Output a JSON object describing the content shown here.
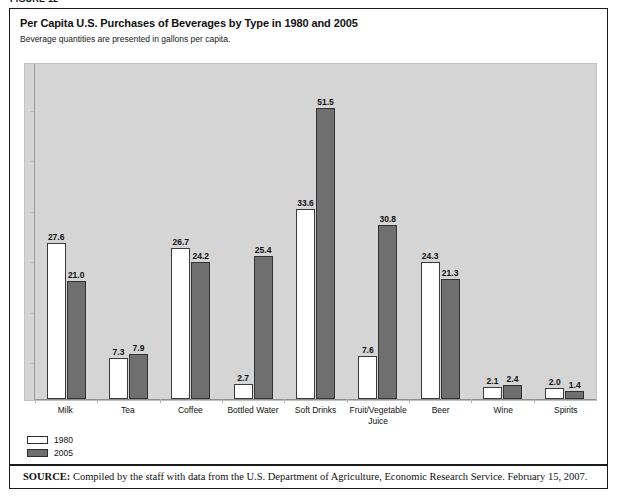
{
  "figure_label": "FIGURE 12",
  "title": "Per Capita U.S. Purchases of Beverages by Type in 1980 and 2005",
  "subtitle": "Beverage quantities are presented in gallons per capita.",
  "legend": {
    "items": [
      {
        "label": "1980",
        "color": "#ffffff"
      },
      {
        "label": "2005",
        "color": "#6f6f6f"
      }
    ]
  },
  "source": {
    "prefix": "SOURCE:",
    "text": " Compiled by the staff with data from the U.S. Department of Agriculture, Economic Research Service. February 15, 2007."
  },
  "chart_data": {
    "type": "bar",
    "title": "Per Capita U.S. Purchases of Beverages by Type in 1980 and 2005",
    "subtitle": "Beverage quantities are presented in gallons per capita.",
    "xlabel": "",
    "ylabel": "",
    "ylim": [
      0,
      56
    ],
    "grid": false,
    "legend_position": "bottom-left",
    "categories": [
      "Milk",
      "Tea",
      "Coffee",
      "Bottled Water",
      "Soft Drinks",
      "Fruit/Vegetable\nJuice",
      "Beer",
      "Wine",
      "Spirits"
    ],
    "series": [
      {
        "name": "1980",
        "color": "#ffffff",
        "values": [
          27.6,
          7.3,
          26.7,
          2.7,
          33.6,
          7.6,
          24.3,
          2.1,
          2.0
        ]
      },
      {
        "name": "2005",
        "color": "#6f6f6f",
        "values": [
          21.0,
          7.9,
          24.2,
          25.4,
          51.5,
          30.8,
          21.3,
          2.4,
          1.4
        ]
      }
    ],
    "value_labels": [
      [
        "27.6",
        "21.0"
      ],
      [
        "7.3",
        "7.9"
      ],
      [
        "26.7",
        "24.2"
      ],
      [
        "2.7",
        "25.4"
      ],
      [
        "33.6",
        "51.5"
      ],
      [
        "7.6",
        "30.8"
      ],
      [
        "24.3",
        "21.3"
      ],
      [
        "2.1",
        "2.4"
      ],
      [
        "2.0",
        "1.4"
      ]
    ]
  }
}
